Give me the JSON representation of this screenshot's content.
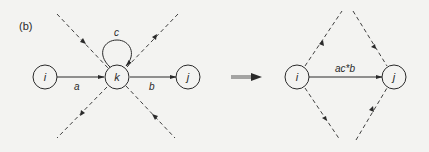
{
  "panel_label": "(b)",
  "left": {
    "nodes": [
      {
        "id": "i",
        "label": "i"
      },
      {
        "id": "k",
        "label": "k"
      },
      {
        "id": "j",
        "label": "j"
      }
    ],
    "edges": [
      {
        "from": "i",
        "to": "k",
        "label": "a"
      },
      {
        "from": "k",
        "to": "j",
        "label": "b"
      },
      {
        "from": "k",
        "to": "k",
        "label": "c"
      }
    ]
  },
  "transform_arrow": "implies",
  "right": {
    "nodes": [
      {
        "id": "i",
        "label": "i"
      },
      {
        "id": "j",
        "label": "j"
      }
    ],
    "edges": [
      {
        "from": "i",
        "to": "j",
        "label": "ac*b"
      }
    ]
  },
  "colors": {
    "line": "#2a2a2a",
    "background": "#f3f3f1"
  }
}
